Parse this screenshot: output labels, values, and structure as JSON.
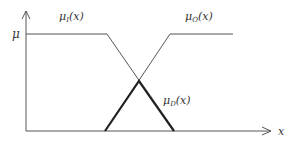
{
  "diagram": {
    "type": "fuzzy membership functions",
    "axes": {
      "y_label": "μ",
      "x_label": "x"
    },
    "curves": [
      {
        "id": "mu_I",
        "label_base": "μ",
        "label_sub": "I",
        "label_arg": "(x)",
        "shape": "left shoulder (falling)"
      },
      {
        "id": "mu_O",
        "label_base": "μ",
        "label_sub": "O",
        "label_arg": "(x)",
        "shape": "right shoulder (rising)"
      },
      {
        "id": "mu_D",
        "label_base": "μ",
        "label_sub": "D",
        "label_arg": "(x)",
        "shape": "triangle (intersection, bold)"
      }
    ],
    "colors": {
      "line": "#555555",
      "bold_line": "#222222",
      "text": "#333333"
    }
  }
}
